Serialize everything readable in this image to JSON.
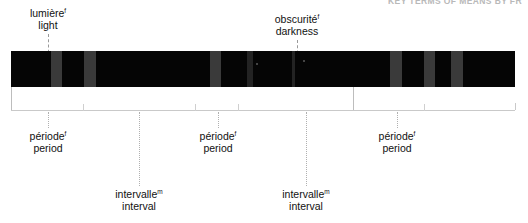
{
  "figure": {
    "running_head": "KEY TERMS OF MEANS BY FR",
    "bar": {
      "x": 11,
      "y": 51,
      "width": 504,
      "height": 36,
      "dark_color": "#050505",
      "light_color": "#3a3a3a",
      "light_bands": [
        {
          "x": 40,
          "width": 11,
          "tone": "light"
        },
        {
          "x": 73,
          "width": 12,
          "tone": "light"
        },
        {
          "x": 199,
          "width": 11,
          "tone": "light"
        },
        {
          "x": 236,
          "width": 6,
          "tone": "dim"
        },
        {
          "x": 281,
          "width": 3,
          "tone": "dim"
        },
        {
          "x": 379,
          "width": 12,
          "tone": "light"
        },
        {
          "x": 413,
          "width": 11,
          "tone": "light"
        },
        {
          "x": 440,
          "width": 12,
          "tone": "light"
        }
      ],
      "specks": [
        {
          "x": 245,
          "y": 12,
          "size": 2
        },
        {
          "x": 292,
          "y": 9,
          "size": 2
        }
      ]
    },
    "callouts": [
      {
        "name": "light",
        "fr": "lumière",
        "fr_sup": "f",
        "en": "light",
        "text_center_x": 48,
        "text_top": 8,
        "leader_x": 48,
        "leader_top": 34,
        "leader_height": 24
      },
      {
        "name": "darkness",
        "fr": "obscurité",
        "fr_sup": "f",
        "en": "darkness",
        "text_center_x": 297,
        "text_top": 14,
        "leader_x": 297,
        "leader_top": 40,
        "leader_height": 24
      }
    ],
    "rule": {
      "y": 110,
      "x_start": 11,
      "x_end": 515,
      "cap_height": 7,
      "color": "#c9c9c9"
    },
    "risers": [
      {
        "x": 11,
        "top": 87,
        "height": 23
      },
      {
        "x": 353,
        "top": 87,
        "height": 23
      }
    ],
    "ticks": [
      {
        "x": 83,
        "top": 104,
        "height": 7,
        "strength": "normal"
      },
      {
        "x": 195,
        "top": 104,
        "height": 7,
        "strength": "normal"
      },
      {
        "x": 238,
        "top": 104,
        "height": 7,
        "strength": "normal"
      },
      {
        "x": 424,
        "top": 104,
        "height": 7,
        "strength": "normal"
      }
    ],
    "bottom_labels": [
      {
        "name": "period-1",
        "fr": "période",
        "fr_sup": "f",
        "en": "period",
        "text_center_x": 48,
        "text_top": 130,
        "drop_x": 48,
        "drop_top": 112,
        "drop_height": 16
      },
      {
        "name": "interval-1",
        "fr": "intervalle",
        "fr_sup": "m",
        "en": "interval",
        "text_center_x": 139,
        "text_top": 188,
        "drop_x": 139,
        "drop_top": 112,
        "drop_height": 74
      },
      {
        "name": "period-2",
        "fr": "période",
        "fr_sup": "f",
        "en": "period",
        "text_center_x": 218,
        "text_top": 130,
        "drop_x": 218,
        "drop_top": 112,
        "drop_height": 16
      },
      {
        "name": "interval-2",
        "fr": "intervalle",
        "fr_sup": "m",
        "en": "interval",
        "text_center_x": 306,
        "text_top": 188,
        "drop_x": 306,
        "drop_top": 112,
        "drop_height": 74
      },
      {
        "name": "period-3",
        "fr": "période",
        "fr_sup": "f",
        "en": "period",
        "text_center_x": 397,
        "text_top": 130,
        "drop_x": 397,
        "drop_top": 112,
        "drop_height": 16
      }
    ]
  }
}
